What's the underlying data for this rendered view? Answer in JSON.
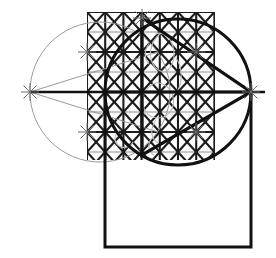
{
  "document": {
    "title": "Geometric construction sketch",
    "media": "pencil-on-paper scan",
    "canvas": {
      "width": 276,
      "height": 258,
      "background": "#ffffff"
    }
  },
  "palette": {
    "ink_dark": "#111111",
    "ink_mid": "#3a3a3a",
    "ink_light": "#9a9a9a",
    "ink_faint": "#b9b9b9",
    "paper": "#ffffff"
  },
  "figures": {
    "light_circle": {
      "label": "construction circle (light)",
      "cx": 100,
      "cy": 92,
      "r": 70,
      "stroke": "#9a9a9a",
      "stroke_width": 1
    },
    "dark_circle": {
      "label": "main circle (heavy)",
      "cx": 178,
      "cy": 92,
      "r": 73,
      "stroke": "#111111",
      "stroke_width": 3
    },
    "dark_triangle": {
      "label": "inscribed triangle pointing right",
      "points": "142,18 251,92 142,155",
      "stroke": "#111111",
      "stroke_width": 3.2
    },
    "light_triangle": {
      "label": "mirrored construction triangle pointing left",
      "points": "158,52 30,92 158,132",
      "stroke": "#9a9a9a",
      "stroke_width": 1
    },
    "square": {
      "label": "large square below",
      "x": 105,
      "y": 92,
      "width": 146,
      "height": 155,
      "stroke": "#111111",
      "stroke_width": 3
    },
    "horizontal_axis": {
      "label": "horizontal axis through centres",
      "x1": 30,
      "y1": 92,
      "x2": 265,
      "y2": 92,
      "stroke": "#111111",
      "stroke_width": 2.4
    },
    "vertical_axis": {
      "label": "vertical axis through triangle apex",
      "x1": 142,
      "y1": 18,
      "x2": 142,
      "y2": 155,
      "stroke": "#111111",
      "stroke_width": 2.4
    }
  },
  "lattice": {
    "label": "triangular lattice grid",
    "origin_x": 87,
    "origin_y": 12,
    "cell_width": 18.2,
    "cell_height": 20.0,
    "columns": 9,
    "rows": 8,
    "stroke_dark": "#1c1c1c",
    "stroke_light": "#8d8d8d",
    "stroke_width_dark": 2.1,
    "stroke_width_light": 1.1,
    "clip_left": 87,
    "clip_right": 215,
    "clip_top": 12,
    "clip_bottom": 160
  },
  "tick_marks": {
    "label": "small construction cross marks",
    "size": 9,
    "stroke": "#6f6f6f",
    "stroke_width": 1,
    "points": [
      {
        "x": 30,
        "y": 92,
        "name": "left-vertex-tick"
      },
      {
        "x": 251,
        "y": 92,
        "name": "right-vertex-tick"
      },
      {
        "x": 87,
        "y": 52,
        "name": "grid-top-left-tick"
      },
      {
        "x": 87,
        "y": 132,
        "name": "grid-bottom-left-tick"
      },
      {
        "x": 196,
        "y": 52,
        "name": "grid-top-right-tick"
      },
      {
        "x": 196,
        "y": 132,
        "name": "grid-bottom-right-tick"
      },
      {
        "x": 142,
        "y": 18,
        "name": "apex-tick"
      }
    ]
  },
  "inner_sketch": {
    "label": "faint freehand sketch inside lattice",
    "stroke": "#b9b9b9",
    "stroke_width": 1.1,
    "paths": [
      "M160,34 C152,40 148,52 152,62 C155,70 163,74 168,70",
      "M168,70 C174,64 176,54 172,44 C169,36 162,31 156,34",
      "M150,86 C142,92 140,104 146,112 C152,120 164,120 170,112",
      "M170,112 C176,104 174,92 166,86 C160,82 154,82 150,86",
      "M156,120 C150,128 150,138 158,143",
      "M143,96 C138,102 139,110 145,114",
      "M176,58 C182,66 183,80 178,90",
      "M149,44 C144,50 144,58 149,64",
      "M120,130 C114,134 113,142 119,146 C124,149 131,147 133,142",
      "M152,138 C147,144 148,152 154,155"
    ]
  }
}
